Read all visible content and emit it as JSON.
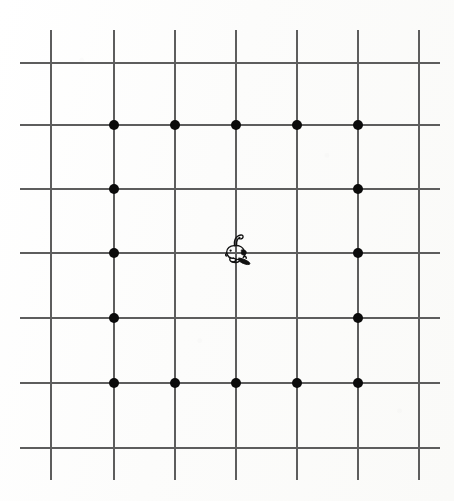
{
  "page": {
    "width": 454,
    "height": 501,
    "background_color": "#fdfdfc"
  },
  "figure": {
    "name": "grid-figure",
    "line_color": "#5d5d5d",
    "dot_color": "#0b0b0b",
    "ink_color": "#111111",
    "line_thickness_px": 2,
    "dot_diameter_px": 10
  },
  "chart_data": {
    "type": "scatter",
    "subtitle": "",
    "xlabel": "",
    "ylabel": "",
    "grid": true,
    "legend": "none",
    "xlim": [
      0,
      6
    ],
    "ylim": [
      0,
      6
    ],
    "x_tick_labels": [
      "0",
      "1",
      "2",
      "3",
      "4",
      "5",
      "6"
    ],
    "y_tick_labels": [
      "0",
      "1",
      "2",
      "3",
      "4",
      "5",
      "6"
    ],
    "grid_columns": 7,
    "grid_rows": 7,
    "vertical_line_x_px": [
      50,
      113,
      174,
      235,
      296,
      357,
      418
    ],
    "horizontal_line_y_px": [
      62,
      124,
      188,
      252,
      317,
      382,
      447
    ],
    "vertical_line_span_y_px": [
      30,
      480
    ],
    "horizontal_line_span_x_px": [
      20,
      440
    ],
    "dot_count": 16,
    "dots_grid_coords": [
      [
        1,
        5
      ],
      [
        2,
        5
      ],
      [
        3,
        5
      ],
      [
        4,
        5
      ],
      [
        5,
        5
      ],
      [
        1,
        4
      ],
      [
        5,
        4
      ],
      [
        1,
        3
      ],
      [
        5,
        3
      ],
      [
        1,
        2
      ],
      [
        5,
        2
      ],
      [
        1,
        1
      ],
      [
        2,
        1
      ],
      [
        3,
        1
      ],
      [
        4,
        1
      ],
      [
        5,
        1
      ]
    ],
    "dots_px": [
      {
        "x": 113,
        "y": 124
      },
      {
        "x": 174,
        "y": 124
      },
      {
        "x": 235,
        "y": 124
      },
      {
        "x": 296,
        "y": 124
      },
      {
        "x": 357,
        "y": 124
      },
      {
        "x": 113,
        "y": 188
      },
      {
        "x": 357,
        "y": 188
      },
      {
        "x": 113,
        "y": 252
      },
      {
        "x": 357,
        "y": 252
      },
      {
        "x": 113,
        "y": 317
      },
      {
        "x": 357,
        "y": 317
      },
      {
        "x": 113,
        "y": 382
      },
      {
        "x": 174,
        "y": 382
      },
      {
        "x": 235,
        "y": 382
      },
      {
        "x": 296,
        "y": 382
      },
      {
        "x": 357,
        "y": 382
      }
    ],
    "annotations": [
      {
        "name": "animal-sketch",
        "label": "small inked animal figure",
        "x_px": 236,
        "y_px": 251,
        "width_px": 34,
        "height_px": 36
      }
    ]
  },
  "icons": {
    "animal": "animal-sketch-icon"
  }
}
